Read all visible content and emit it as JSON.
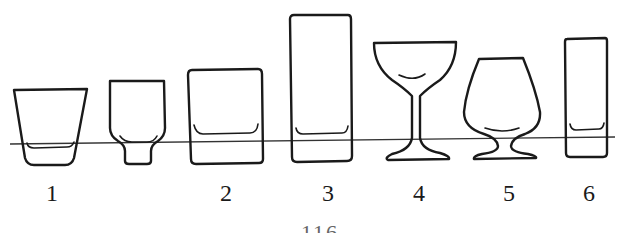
{
  "figure": {
    "glasses": [
      {
        "id": "1",
        "label": "1",
        "shape": "tapered-tumbler"
      },
      {
        "id": "unlabeled",
        "label": "",
        "shape": "footed-tumbler"
      },
      {
        "id": "2",
        "label": "2",
        "shape": "rocks-glass"
      },
      {
        "id": "3",
        "label": "3",
        "shape": "highball-glass"
      },
      {
        "id": "4",
        "label": "4",
        "shape": "coupe-glass"
      },
      {
        "id": "5",
        "label": "5",
        "shape": "snifter-glass"
      },
      {
        "id": "6",
        "label": "6",
        "shape": "shot-tall-glass"
      }
    ],
    "labels": [
      "1",
      "2",
      "3",
      "4",
      "5",
      "6"
    ],
    "page_number": "116"
  },
  "colors": {
    "ink": "#1a1a1a",
    "background": "#ffffff"
  }
}
